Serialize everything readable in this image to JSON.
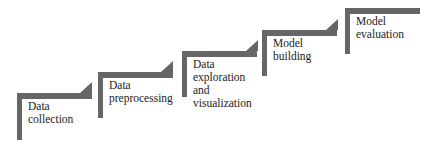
{
  "diagram": {
    "type": "staircase-process",
    "bar_color": "#666666",
    "steps": [
      {
        "label": "Data\ncollection"
      },
      {
        "label": "Data\npreprocessing"
      },
      {
        "label": "Data\nexploration\nand\nvisualization"
      },
      {
        "label": "Model\nbuilding"
      },
      {
        "label": "Model\nevaluation"
      }
    ]
  }
}
